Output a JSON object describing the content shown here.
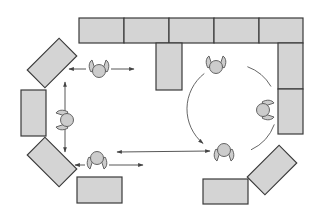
{
  "diagram": {
    "title": "Classroom seating layout with movement paths",
    "colors": {
      "background": "#ffffff",
      "desk_fill": "#d4d4d4",
      "desk_stroke": "#3a3a3a",
      "person_fill": "#cccccc",
      "person_stroke": "#555555",
      "arrow": "#444444",
      "circle_path": "#555555"
    },
    "desks": [
      {
        "id": "top-1",
        "x": 79,
        "y": 18,
        "w": 45,
        "h": 25,
        "rot": 0
      },
      {
        "id": "top-2",
        "x": 124,
        "y": 18,
        "w": 45,
        "h": 25,
        "rot": 0
      },
      {
        "id": "top-3",
        "x": 169,
        "y": 18,
        "w": 45,
        "h": 25,
        "rot": 0
      },
      {
        "id": "top-4",
        "x": 214,
        "y": 18,
        "w": 45,
        "h": 25,
        "rot": 0
      },
      {
        "id": "top-5",
        "x": 259,
        "y": 18,
        "w": 44,
        "h": 25,
        "rot": 0
      },
      {
        "id": "center-drop",
        "x": 156,
        "y": 43,
        "w": 26,
        "h": 47,
        "rot": 0
      },
      {
        "id": "right-1",
        "x": 278,
        "y": 43,
        "w": 25,
        "h": 46,
        "rot": 0
      },
      {
        "id": "right-2",
        "x": 278,
        "y": 89,
        "w": 25,
        "h": 45,
        "rot": 0
      },
      {
        "id": "left-top-angled",
        "cx": 52,
        "cy": 63,
        "w": 45,
        "h": 25,
        "rot": -45
      },
      {
        "id": "left-middle",
        "x": 21,
        "y": 90,
        "w": 25,
        "h": 46,
        "rot": 0
      },
      {
        "id": "left-bottom-angled",
        "cx": 52,
        "cy": 162,
        "w": 45,
        "h": 25,
        "rot": 45
      },
      {
        "id": "bottom-left",
        "x": 77,
        "y": 177,
        "w": 45,
        "h": 26,
        "rot": 0
      },
      {
        "id": "bottom-right",
        "x": 203,
        "y": 179,
        "w": 45,
        "h": 25,
        "rot": 0
      },
      {
        "id": "right-bottom-angled",
        "cx": 272,
        "cy": 170,
        "w": 45,
        "h": 25,
        "rot": -45
      }
    ],
    "people": [
      {
        "id": "person-top-left",
        "x": 99,
        "y": 70,
        "facing": "up"
      },
      {
        "id": "person-left",
        "x": 66,
        "y": 120,
        "facing": "left"
      },
      {
        "id": "person-bottom-left",
        "x": 97,
        "y": 159,
        "facing": "down"
      },
      {
        "id": "person-top-right",
        "x": 216,
        "y": 66,
        "facing": "up"
      },
      {
        "id": "person-right",
        "x": 264,
        "y": 110,
        "facing": "right"
      },
      {
        "id": "person-bottom-right",
        "x": 224,
        "y": 151,
        "facing": "down"
      }
    ],
    "arrows": [
      {
        "id": "arrow-top-left-to-desk",
        "x1": 86,
        "y1": 69,
        "x2": 69,
        "y2": 69,
        "heads": "end"
      },
      {
        "id": "arrow-top-left-right",
        "x1": 111,
        "y1": 69,
        "x2": 134,
        "y2": 69,
        "heads": "end"
      },
      {
        "id": "arrow-left-vertical",
        "x1": 65,
        "y1": 82,
        "x2": 65,
        "y2": 152,
        "heads": "both"
      },
      {
        "id": "arrow-bottom-left-to-desk",
        "x1": 85,
        "y1": 165,
        "x2": 75,
        "y2": 165,
        "heads": "end"
      },
      {
        "id": "arrow-bottom-left-right",
        "x1": 109,
        "y1": 165,
        "x2": 143,
        "y2": 165,
        "heads": "end"
      },
      {
        "id": "arrow-middle-horizontal",
        "x1": 117,
        "y1": 152,
        "x2": 210,
        "y2": 151,
        "heads": "both"
      }
    ],
    "circle_path": {
      "cx": 232,
      "cy": 109,
      "r": 45,
      "note": "Dashed arc of rotation among three right-side people with arrowhead near lower-left"
    }
  }
}
